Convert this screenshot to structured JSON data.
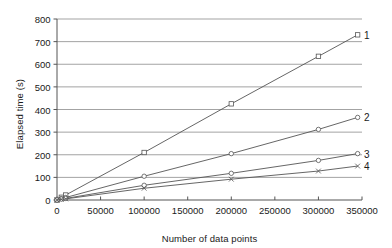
{
  "chart_data": {
    "type": "line",
    "title": "",
    "xlabel": "Number of data points",
    "ylabel": "Elapsed time (s)",
    "xlim": [
      0,
      350000
    ],
    "ylim": [
      0,
      800
    ],
    "xticks": [
      0,
      50000,
      100000,
      150000,
      200000,
      250000,
      300000,
      350000
    ],
    "xtick_labels": [
      "0",
      "50000",
      "100000",
      "150000",
      "200000",
      "250000",
      "300000",
      "350000"
    ],
    "yticks": [
      0,
      100,
      200,
      300,
      400,
      500,
      600,
      700,
      800
    ],
    "ytick_labels": [
      "0",
      "100",
      "200",
      "300",
      "400",
      "500",
      "600",
      "700",
      "800"
    ],
    "grid": {
      "horizontal": true,
      "vertical": false
    },
    "legend": {
      "position": "right-of-line-ends",
      "style": "end-of-line-number"
    },
    "line_color": "#555555",
    "grid_color": "#999999",
    "axis_color": "#555555",
    "series": [
      {
        "name": "1",
        "label": "1",
        "marker": "square",
        "x": [
          0,
          5000,
          10000,
          100000,
          200000,
          300000,
          345000
        ],
        "values": [
          0,
          12,
          22,
          210,
          425,
          635,
          730
        ]
      },
      {
        "name": "2",
        "label": "2",
        "marker": "circle",
        "x": [
          0,
          5000,
          10000,
          100000,
          200000,
          300000,
          345000
        ],
        "values": [
          0,
          6,
          11,
          105,
          205,
          312,
          365
        ]
      },
      {
        "name": "3",
        "label": "3",
        "marker": "circle",
        "x": [
          0,
          5000,
          10000,
          100000,
          200000,
          300000,
          345000
        ],
        "values": [
          0,
          4,
          7,
          65,
          118,
          175,
          205
        ]
      },
      {
        "name": "4",
        "label": "4",
        "marker": "cross",
        "x": [
          0,
          5000,
          10000,
          100000,
          200000,
          300000,
          345000
        ],
        "values": [
          0,
          3,
          5,
          52,
          92,
          128,
          150
        ]
      }
    ]
  },
  "plot_geometry": {
    "left": 57,
    "right": 362,
    "top": 19,
    "bottom": 200
  }
}
